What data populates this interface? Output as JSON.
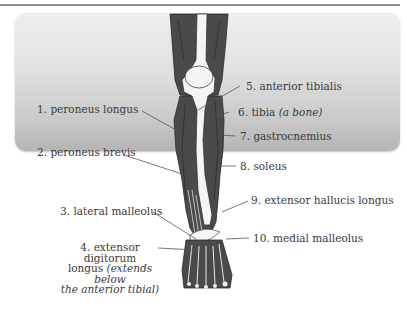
{
  "diagram": {
    "colors": {
      "background_top": "#efefef",
      "background_bottom": "#b3b3b3",
      "muscle": "#4a4a4a",
      "bone": "#f4f4f4",
      "leader_line": "#555555",
      "text": "#3a3a3a"
    },
    "labels": {
      "left": [
        {
          "number": "1.",
          "text": "peroneus longus"
        },
        {
          "number": "2.",
          "text": "peroneus brevis"
        },
        {
          "number": "3.",
          "text": "lateral malleolus"
        },
        {
          "number": "4.",
          "text": "extensor digitorum",
          "line2": "longus",
          "note": "(extends below",
          "note2": "the anterior tibial)"
        }
      ],
      "right": [
        {
          "number": "5.",
          "text": "anterior tibialis"
        },
        {
          "number": "6.",
          "text": "tibia",
          "note": "(a bone)"
        },
        {
          "number": "7.",
          "text": "gastrocnemius"
        },
        {
          "number": "8.",
          "text": "soleus"
        },
        {
          "number": "9.",
          "text": "extensor hallucis longus"
        },
        {
          "number": "10.",
          "text": "medial malleolus"
        }
      ]
    }
  }
}
